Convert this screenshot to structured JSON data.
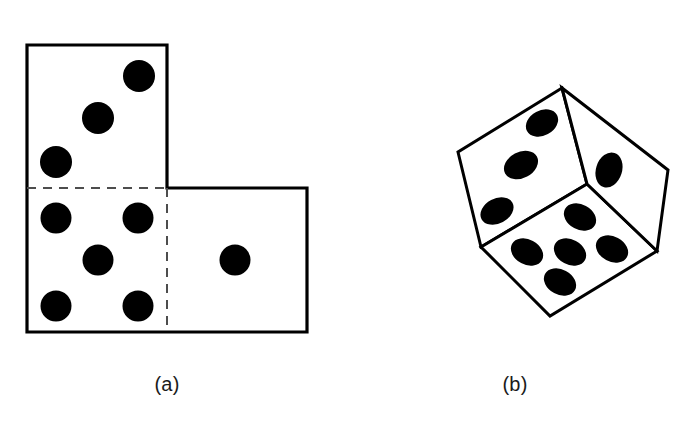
{
  "figure": {
    "background_color": "#ffffff",
    "stroke_color": "#000000",
    "pip_color": "#000000",
    "fold_line_style": "dashed",
    "panels": [
      {
        "label": "(a)",
        "name": "dice-net-panel",
        "description": "Partial net of a die: three squares in an L shape with dashed fold lines",
        "faces": [
          {
            "name": "net-face-top",
            "pip_count": 3,
            "pip_layout": "diagonal"
          },
          {
            "name": "net-face-bottom-left",
            "pip_count": 5,
            "pip_layout": "quincunx"
          },
          {
            "name": "net-face-bottom-right",
            "pip_count": 1,
            "pip_layout": "center"
          }
        ]
      },
      {
        "label": "(b)",
        "name": "dice-cube-panel",
        "description": "Tilted 3D cube (die) showing three faces",
        "faces": [
          {
            "name": "cube-face-top-left",
            "pip_count": 3,
            "pip_layout": "diagonal"
          },
          {
            "name": "cube-face-front",
            "pip_count": 5,
            "pip_layout": "quincunx"
          },
          {
            "name": "cube-face-right",
            "pip_count": 1,
            "pip_layout": "upper"
          }
        ]
      }
    ]
  },
  "net": {
    "outline_points": "27,45 167,45 167,188 307,188 307,332 27,332",
    "fold_lines": [
      {
        "name": "fold-line-horizontal",
        "x1": 27,
        "y1": 188,
        "x2": 167,
        "y2": 188
      },
      {
        "name": "fold-line-vertical",
        "x1": 167,
        "y1": 188,
        "x2": 167,
        "y2": 332
      }
    ],
    "stroke_width": 3.2,
    "fold_stroke_width": 2,
    "fold_dash": "9 7",
    "pips": [
      {
        "face": "top",
        "cx": 139,
        "cy": 76,
        "r": 16
      },
      {
        "face": "top",
        "cx": 98,
        "cy": 118,
        "r": 16
      },
      {
        "face": "top",
        "cx": 56,
        "cy": 162,
        "r": 16
      },
      {
        "face": "bottom-left",
        "cx": 56,
        "cy": 218,
        "r": 15.5
      },
      {
        "face": "bottom-left",
        "cx": 138,
        "cy": 218,
        "r": 15.5
      },
      {
        "face": "bottom-left",
        "cx": 98,
        "cy": 260,
        "r": 15.5
      },
      {
        "face": "bottom-left",
        "cx": 56,
        "cy": 306,
        "r": 15.5
      },
      {
        "face": "bottom-left",
        "cx": 138,
        "cy": 306,
        "r": 15.5
      },
      {
        "face": "bottom-right",
        "cx": 235,
        "cy": 260,
        "r": 15.5
      }
    ]
  },
  "cube": {
    "vertices": {
      "top": [
        562,
        88
      ],
      "left_upper": [
        458,
        152
      ],
      "center": [
        587,
        184
      ],
      "right": [
        657,
        251
      ],
      "left_lower": [
        481,
        247
      ],
      "bottom": [
        550,
        316
      ],
      "far_right_upper": [
        668,
        170
      ]
    },
    "faces": [
      {
        "name": "cube-face-top-left",
        "points": "562,88 458,152 481,247 587,184",
        "pips": [
          {
            "cx": 542,
            "cy": 123,
            "rx": 17,
            "ry": 12.5,
            "rot": -28
          },
          {
            "cx": 521,
            "cy": 165,
            "rx": 18,
            "ry": 13,
            "rot": -28
          },
          {
            "cx": 497,
            "cy": 211,
            "rx": 17.5,
            "ry": 12.5,
            "rot": -28
          }
        ]
      },
      {
        "name": "cube-face-front",
        "points": "481,247 587,184 657,251 550,316",
        "pips": [
          {
            "cx": 580,
            "cy": 217,
            "rx": 17,
            "ry": 12.5,
            "rot": 28
          },
          {
            "cx": 527,
            "cy": 252,
            "rx": 17,
            "ry": 12.5,
            "rot": 28
          },
          {
            "cx": 570,
            "cy": 252,
            "rx": 17,
            "ry": 12.5,
            "rot": 28
          },
          {
            "cx": 612,
            "cy": 249,
            "rx": 17,
            "ry": 12.5,
            "rot": 28
          },
          {
            "cx": 560,
            "cy": 282,
            "rx": 17,
            "ry": 12.5,
            "rot": 28
          }
        ]
      },
      {
        "name": "cube-face-right",
        "points": "562,88 587,184 657,251 668,170",
        "pips": [
          {
            "cx": 609,
            "cy": 170,
            "rx": 13,
            "ry": 18,
            "rot": 18
          }
        ]
      }
    ],
    "stroke_width": 3.0,
    "inner_stroke_width": 1.6
  },
  "captions": {
    "a": "(a)",
    "b": "(b)"
  }
}
